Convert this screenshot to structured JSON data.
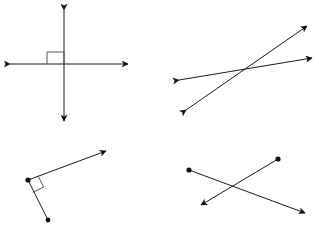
{
  "document": {
    "kind": "geometry-worksheet-figures",
    "description": "Four line-relationship diagrams arranged in a 2x2 grid on a white background",
    "background_color": "#ffffff",
    "stroke_color": "#1a1a1a",
    "marker_color": "#555555",
    "width": 319,
    "height": 231
  },
  "figures": [
    {
      "id": "top-left",
      "name": "perpendicular-lines",
      "label": "",
      "has_right_angle_mark": true,
      "elements": [
        {
          "type": "line",
          "name": "vertical-line",
          "x1": 64,
          "y1": 10,
          "x2": 64,
          "y2": 121,
          "arrows": "both"
        },
        {
          "type": "line",
          "name": "horizontal-line",
          "x1": 10,
          "y1": 64,
          "x2": 128,
          "y2": 64,
          "arrows": "both"
        },
        {
          "type": "right-angle-square",
          "name": "right-angle-marker",
          "x": 47,
          "y": 52,
          "w": 17,
          "h": 12
        }
      ]
    },
    {
      "id": "top-right",
      "name": "intersecting-lines",
      "label": "",
      "has_right_angle_mark": false,
      "elements": [
        {
          "type": "line",
          "name": "shallow-line",
          "x1": 179,
          "y1": 80,
          "x2": 312,
          "y2": 58,
          "arrows": "both"
        },
        {
          "type": "line",
          "name": "steep-line",
          "x1": 186,
          "y1": 110,
          "x2": 307,
          "y2": 26,
          "arrows": "both"
        }
      ]
    },
    {
      "id": "bottom-left",
      "name": "perpendicular-ray-and-segment",
      "label": "",
      "has_right_angle_mark": true,
      "elements": [
        {
          "type": "ray",
          "name": "upper-ray",
          "x1": 28,
          "y1": 180,
          "x2": 106,
          "y2": 151,
          "arrows": "end",
          "dot_at_start": true
        },
        {
          "type": "segment",
          "name": "lower-segment",
          "x1": 28,
          "y1": 180,
          "x2": 48,
          "y2": 220,
          "arrows": "none",
          "dot_at_start": true,
          "dot_at_end": true
        },
        {
          "type": "right-angle-square",
          "name": "right-angle-marker",
          "x": 30,
          "y": 180,
          "size": 12,
          "rotation": -20
        }
      ]
    },
    {
      "id": "bottom-right",
      "name": "crossing-rays",
      "label": "",
      "has_right_angle_mark": false,
      "elements": [
        {
          "type": "ray",
          "name": "ray-down-right",
          "x1": 189,
          "y1": 170,
          "x2": 305,
          "y2": 213,
          "arrows": "end",
          "dot_at_start": true
        },
        {
          "type": "ray",
          "name": "ray-down-left",
          "x1": 278,
          "y1": 159,
          "x2": 201,
          "y2": 205,
          "arrows": "end",
          "dot_at_start": true
        }
      ]
    }
  ]
}
